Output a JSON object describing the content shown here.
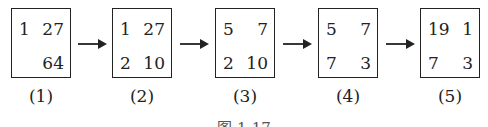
{
  "diagram": {
    "steps": [
      {
        "label": "(1)",
        "cells": {
          "tl": "1",
          "tr": "27",
          "bl": "",
          "br": "64"
        }
      },
      {
        "label": "(2)",
        "cells": {
          "tl": "1",
          "tr": "27",
          "bl": "2",
          "br": "10"
        }
      },
      {
        "label": "(3)",
        "cells": {
          "tl": "5",
          "tr": "7",
          "bl": "2",
          "br": "10"
        }
      },
      {
        "label": "(4)",
        "cells": {
          "tl": "5",
          "tr": "7",
          "bl": "7",
          "br": "3"
        }
      },
      {
        "label": "(5)",
        "cells": {
          "tl": "19",
          "tr": "1",
          "bl": "7",
          "br": "3"
        }
      }
    ],
    "arrow_icon": "right-arrow-icon",
    "caption": "图 1-17"
  }
}
